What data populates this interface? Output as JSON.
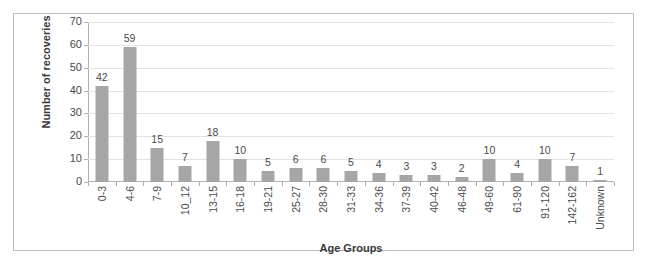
{
  "chart_data": {
    "type": "bar",
    "title": "",
    "xlabel": "Age Groups",
    "ylabel": "Number of recoveries",
    "ylim": [
      0,
      70
    ],
    "ytick_step": 10,
    "yticks": [
      0,
      10,
      20,
      30,
      40,
      50,
      60,
      70
    ],
    "grid": true,
    "legend": "none",
    "bar_color": "#a6a6a6",
    "gridline_color": "#e2e2e2",
    "axis_color": "#b0b0b0",
    "border_color": "#b9b9b9",
    "categories": [
      "0-3",
      "4-6",
      "7-9",
      "10_12",
      "13-15",
      "16-18",
      "19-21",
      "25-27",
      "28-30",
      "31-33",
      "34-36",
      "37-39",
      "40-42",
      "46-48",
      "49-60",
      "61-90",
      "91-120",
      "142-162",
      "Unknown"
    ],
    "values": [
      42,
      59,
      15,
      7,
      18,
      10,
      5,
      6,
      6,
      5,
      4,
      3,
      3,
      2,
      10,
      4,
      10,
      7,
      1
    ],
    "data_labels": [
      "42",
      "59",
      "15",
      "7",
      "18",
      "10",
      "5",
      "6",
      "6",
      "5",
      "4",
      "3",
      "3",
      "2",
      "10",
      "4",
      "10",
      "7",
      "1"
    ]
  }
}
